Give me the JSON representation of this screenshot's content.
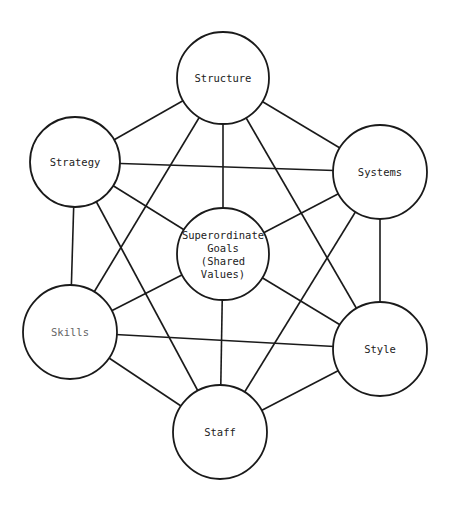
{
  "diagram": {
    "title": "",
    "nodes": [
      {
        "id": "structure",
        "label": "Structure",
        "cx": 223,
        "cy": 78,
        "r": 46
      },
      {
        "id": "strategy",
        "label": "Strategy",
        "cx": 75,
        "cy": 162,
        "r": 45
      },
      {
        "id": "systems",
        "label": "Systems",
        "cx": 380,
        "cy": 172,
        "r": 47
      },
      {
        "id": "center",
        "label_lines": [
          "Superordinate",
          "Goals",
          "(Shared",
          "Values)"
        ],
        "cx": 223,
        "cy": 254,
        "r": 46
      },
      {
        "id": "skills",
        "label": "Skills",
        "cx": 70,
        "cy": 332,
        "r": 47
      },
      {
        "id": "style",
        "label": "Style",
        "cx": 380,
        "cy": 349,
        "r": 47
      },
      {
        "id": "staff",
        "label": "Staff",
        "cx": 220,
        "cy": 432,
        "r": 47
      }
    ],
    "edges": [
      [
        "structure",
        "systems"
      ],
      [
        "systems",
        "style"
      ],
      [
        "style",
        "staff"
      ],
      [
        "staff",
        "skills"
      ],
      [
        "skills",
        "strategy"
      ],
      [
        "strategy",
        "structure"
      ],
      [
        "structure",
        "style"
      ],
      [
        "systems",
        "staff"
      ],
      [
        "style",
        "skills"
      ],
      [
        "staff",
        "strategy"
      ],
      [
        "skills",
        "structure"
      ],
      [
        "strategy",
        "systems"
      ],
      [
        "center",
        "structure"
      ],
      [
        "center",
        "systems"
      ],
      [
        "center",
        "style"
      ],
      [
        "center",
        "staff"
      ],
      [
        "center",
        "skills"
      ],
      [
        "center",
        "strategy"
      ]
    ]
  }
}
